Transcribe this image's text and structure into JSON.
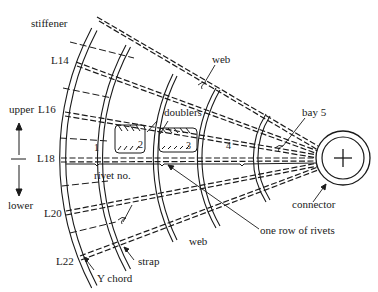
{
  "diagram": {
    "labels": {
      "stiffener": "stiffener",
      "l14": "L14",
      "upper": "upper",
      "l16": "L16",
      "l18": "L18",
      "lower": "lower",
      "l20": "L20",
      "l22": "L22",
      "y_chord": "Y chord",
      "strap": "strap",
      "rivet_no": "rivet no.",
      "doublers": "doublers",
      "web_top": "web",
      "web_bottom": "web",
      "bay5": "bay 5",
      "connector": "connector",
      "one_row_of_rivets": "one row of rivets"
    },
    "bay_numbers": [
      "1",
      "2",
      "3",
      "4"
    ],
    "connector_symbol": "+",
    "colors": {
      "ink": "#1a1a1a",
      "background": "#ffffff"
    }
  }
}
